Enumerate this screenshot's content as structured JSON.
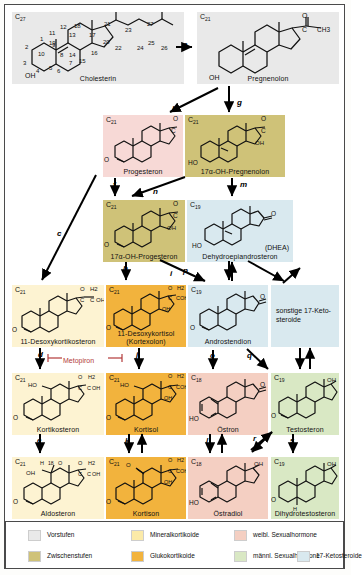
{
  "diagram": {
    "inhibitor": {
      "label": "Metopiron",
      "color": "#b33a3a"
    }
  },
  "palette": {
    "vorstufen": "#e9e9e9",
    "zwischenstufen": "#cfc278",
    "mineralkortikoide": "#fbeaa8",
    "glukokortikoide": "#f2b33d",
    "weibl_sexualhormone": "#f4cfc2",
    "maennl_sexualhormone": "#d9e8c4",
    "ketosteroide": "#d9e9ef",
    "progesteron": "#f7d9d6",
    "desoxykortikosteron": "#fdf3d2"
  },
  "compounds": [
    {
      "id": "cholesterin",
      "cnum": "C27",
      "name": "Cholesterin",
      "category": "vorstufen"
    },
    {
      "id": "pregnenolon",
      "cnum": "C21",
      "name": "Pregnenolon",
      "category": "vorstufen"
    },
    {
      "id": "progesteron",
      "cnum": "C21",
      "name": "Progesteron",
      "category": "weibl_sexualhormone"
    },
    {
      "id": "oh_pregnenolon",
      "cnum": "C21",
      "name": "17α-OH-Pregnenolon",
      "category": "zwischenstufen"
    },
    {
      "id": "oh_progesteron",
      "cnum": "C21",
      "name": "17α-OH-Progesteron",
      "category": "zwischenstufen"
    },
    {
      "id": "dhea",
      "cnum": "C19",
      "name": "Dehydroepiandrosteron",
      "name2": "(DHEA)",
      "category": "ketosteroide"
    },
    {
      "id": "desoxykortikosteron",
      "cnum": "C21",
      "name": "11-Desoxykortikosteron",
      "category": "mineralkortikoide"
    },
    {
      "id": "desoxykortisol",
      "cnum": "C21",
      "name": "11-Desoxykortisol",
      "name2": "(Kortexolon)",
      "category": "glukokortikoide"
    },
    {
      "id": "androstendion",
      "cnum": "C19",
      "name": "Androstendion",
      "category": "ketosteroide"
    },
    {
      "id": "sonstige_ketosteroide",
      "cnum": "",
      "name": "sonstige 17-Keto-steroide",
      "textonly": "sonstige 17-Keto-\nsteroide",
      "category": "ketosteroide"
    },
    {
      "id": "kortikosteron",
      "cnum": "C21",
      "name": "Kortikosteron",
      "category": "mineralkortikoide"
    },
    {
      "id": "kortisol",
      "cnum": "C21",
      "name": "Kortisol",
      "category": "glukokortikoide"
    },
    {
      "id": "oestron",
      "cnum": "C18",
      "name": "Östron",
      "category": "weibl_sexualhormone"
    },
    {
      "id": "testosteron",
      "cnum": "C19",
      "name": "Testosteron",
      "category": "maennl_sexualhormone"
    },
    {
      "id": "aldosteron",
      "cnum": "C21",
      "name": "Aldosteron",
      "category": "mineralkortikoide"
    },
    {
      "id": "kortison",
      "cnum": "C21",
      "name": "Kortison",
      "category": "glukokortikoide"
    },
    {
      "id": "oestradiol",
      "cnum": "C18",
      "name": "Östradiol",
      "category": "weibl_sexualhormone"
    },
    {
      "id": "dihydrotestosteron",
      "cnum": "C19",
      "name": "Dihydrotestosteron",
      "category": "maennl_sexualhormone"
    }
  ],
  "enzyme_labels": [
    {
      "id": "a",
      "label": "a"
    },
    {
      "id": "b",
      "label": "b"
    },
    {
      "id": "c",
      "label": "c"
    },
    {
      "id": "d",
      "label": "d"
    },
    {
      "id": "e",
      "label": "e"
    },
    {
      "id": "f",
      "label": "f"
    },
    {
      "id": "g",
      "label": "g"
    },
    {
      "id": "h",
      "label": "h"
    },
    {
      "id": "i",
      "label": "i"
    },
    {
      "id": "j",
      "label": "j"
    },
    {
      "id": "k",
      "label": "k"
    },
    {
      "id": "l",
      "label": "l"
    },
    {
      "id": "m",
      "label": "m"
    },
    {
      "id": "n",
      "label": "n"
    },
    {
      "id": "o",
      "label": "o"
    },
    {
      "id": "p",
      "label": "p"
    },
    {
      "id": "q",
      "label": "q"
    },
    {
      "id": "r",
      "label": "r"
    },
    {
      "id": "s",
      "label": "s"
    }
  ],
  "cholesterin_numbering": [
    "1",
    "2",
    "3",
    "4",
    "5",
    "6",
    "7",
    "8",
    "9",
    "10",
    "11",
    "12",
    "13",
    "14",
    "15",
    "16",
    "17",
    "18",
    "19",
    "20",
    "21",
    "22",
    "23",
    "24",
    "25",
    "26",
    "27"
  ],
  "legend": {
    "row1": [
      {
        "label": "Vorstufen",
        "color": "#e9e9e9"
      },
      {
        "label": "Mineralkortikoide",
        "color": "#fbeaa8"
      },
      {
        "label": "weibl. Sexualhormone",
        "color": "#f4cfc2"
      }
    ],
    "row2": [
      {
        "label": "Zwischenstufen",
        "color": "#cfc278"
      },
      {
        "label": "Glukokortikoide",
        "color": "#f2b33d"
      },
      {
        "label": "männl. Sexualhormone",
        "color": "#d9e8c4"
      },
      {
        "label": "17-Ketosteroide",
        "color": "#d9e9ef"
      }
    ]
  },
  "atoms": {
    "OH": "OH",
    "HO": "HO",
    "O": "O",
    "CH3": "CH3",
    "C": "C",
    "H": "H",
    "H2": "H2",
    "C21": "21",
    "C18": "18"
  }
}
